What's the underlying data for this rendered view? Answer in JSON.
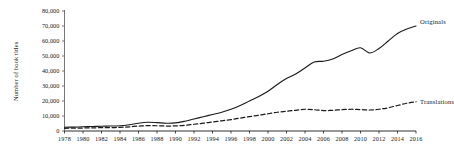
{
  "chart_data": {
    "type": "line",
    "title": "",
    "xlabel": "",
    "ylabel": "Number of book titles",
    "x": [
      1978,
      1979,
      1980,
      1981,
      1982,
      1983,
      1984,
      1985,
      1986,
      1987,
      1988,
      1989,
      1990,
      1991,
      1992,
      1993,
      1994,
      1995,
      1996,
      1997,
      1998,
      1999,
      2000,
      2001,
      2002,
      2003,
      2004,
      2005,
      2006,
      2007,
      2008,
      2009,
      2010,
      2011,
      2012,
      2013,
      2014,
      2015,
      2016
    ],
    "xlim": [
      1978,
      2016
    ],
    "ylim": [
      0,
      80000
    ],
    "yticks": [
      0,
      10000,
      20000,
      30000,
      40000,
      50000,
      60000,
      70000,
      80000
    ],
    "ytick_labels": [
      "0",
      "10,000",
      "20,000",
      "30,000",
      "40,000",
      "50,000",
      "60,000",
      "70,000",
      "80,000"
    ],
    "xticks": [
      1978,
      1980,
      1982,
      1984,
      1986,
      1988,
      1990,
      1992,
      1994,
      1996,
      1998,
      2000,
      2002,
      2004,
      2006,
      2008,
      2010,
      2012,
      2014,
      2016
    ],
    "xtick_labels": [
      "1978",
      "1980",
      "1982",
      "1984",
      "1986",
      "1988",
      "1990",
      "1992",
      "1994",
      "1996",
      "1998",
      "2000",
      "2002",
      "2004",
      "2006",
      "2008",
      "2010",
      "2012",
      "2014",
      "2016"
    ],
    "grid": false,
    "legend_position": "right-inline",
    "series": [
      {
        "name": "Originals",
        "style": "solid",
        "color": "#1a1a1a",
        "values": [
          2500,
          2600,
          2800,
          3000,
          3200,
          3300,
          3500,
          4200,
          5200,
          5800,
          5600,
          5200,
          5400,
          6500,
          8000,
          9500,
          11000,
          12500,
          14500,
          17000,
          20000,
          23000,
          26500,
          31000,
          35000,
          38000,
          42000,
          46000,
          46500,
          48000,
          51000,
          53500,
          55500,
          52000,
          55000,
          60000,
          65000,
          68000,
          70000
        ]
      },
      {
        "name": "Translations",
        "style": "dashed",
        "color": "#1a1a1a",
        "values": [
          1800,
          1900,
          2000,
          2100,
          2200,
          2300,
          2400,
          2800,
          3300,
          3600,
          3500,
          3300,
          3400,
          3800,
          4500,
          5200,
          6000,
          6800,
          7600,
          8600,
          9600,
          10500,
          11500,
          12500,
          13200,
          13800,
          14500,
          14200,
          13600,
          13800,
          14200,
          14500,
          14300,
          14000,
          14500,
          15500,
          17000,
          18500,
          19500
        ]
      }
    ]
  }
}
